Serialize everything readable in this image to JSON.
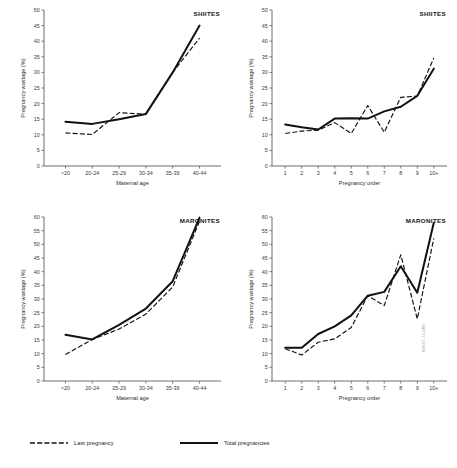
{
  "figure": {
    "credit": "88937-74.4R5"
  },
  "legend": {
    "items": [
      {
        "label": "Last pregnancy",
        "style": "dashed"
      },
      {
        "label": "Total pregnancies",
        "style": "solid"
      }
    ]
  },
  "chart_data": [
    {
      "id": "shiites-maternal-age",
      "type": "line",
      "title": "SHIITES",
      "xlabel": "Maternal age",
      "ylabel": "Pregnancy wastage (%)",
      "categories": [
        "<20",
        "20-24",
        "25-29",
        "30-34",
        "35-39",
        "40-44"
      ],
      "ylim": [
        0,
        50
      ],
      "yticks": [
        0,
        5,
        10,
        15,
        20,
        25,
        30,
        35,
        40,
        45,
        50
      ],
      "grid": false,
      "legend_position": "figure-bottom",
      "series": [
        {
          "name": "Total pregnancies",
          "style": "solid",
          "values": [
            14.2,
            13.5,
            15.0,
            16.7,
            30.0,
            45.0
          ]
        },
        {
          "name": "Last pregnancy",
          "style": "dashed",
          "values": [
            10.6,
            10.1,
            17.1,
            16.6,
            30.0,
            41.0
          ]
        }
      ]
    },
    {
      "id": "shiites-pregnancy-order",
      "type": "line",
      "title": "SHIITES",
      "xlabel": "Pregnancy order",
      "ylabel": "Pregnancy wastage (%)",
      "categories": [
        "1",
        "2",
        "3",
        "4",
        "5",
        "6",
        "7",
        "8",
        "9",
        "10+"
      ],
      "ylim": [
        0,
        50
      ],
      "yticks": [
        0,
        5,
        10,
        15,
        20,
        25,
        30,
        35,
        40,
        45,
        50
      ],
      "grid": false,
      "legend_position": "figure-bottom",
      "series": [
        {
          "name": "Total pregnancies",
          "style": "solid",
          "values": [
            13.3,
            12.4,
            11.7,
            15.2,
            15.3,
            15.2,
            17.5,
            19.0,
            22.5,
            31.2
          ]
        },
        {
          "name": "Last pregnancy",
          "style": "dashed",
          "values": [
            10.4,
            11.2,
            11.5,
            13.9,
            10.4,
            19.4,
            10.8,
            22.0,
            22.4,
            34.6
          ]
        }
      ]
    },
    {
      "id": "maronites-maternal-age",
      "type": "line",
      "title": "MARONITES",
      "xlabel": "Maternal age",
      "ylabel": "Pregnancy wastage (%)",
      "categories": [
        "<20",
        "20-24",
        "25-29",
        "30-34",
        "35-39",
        "40-44"
      ],
      "ylim": [
        0,
        60
      ],
      "yticks": [
        0,
        5,
        10,
        15,
        20,
        25,
        30,
        35,
        40,
        45,
        50,
        55,
        60
      ],
      "grid": false,
      "legend_position": "figure-bottom",
      "series": [
        {
          "name": "Total pregnancies",
          "style": "solid",
          "values": [
            16.9,
            15.2,
            20.5,
            26.5,
            36.5,
            59.8
          ]
        },
        {
          "name": "Last pregnancy",
          "style": "dashed",
          "values": [
            9.7,
            15.2,
            19.0,
            24.5,
            34.4,
            58.5
          ]
        }
      ]
    },
    {
      "id": "maronites-pregnancy-order",
      "type": "line",
      "title": "MARONITES",
      "xlabel": "Pregnancy order",
      "ylabel": "Pregnancy wastage (%)",
      "categories": [
        "1",
        "2",
        "3",
        "4",
        "5",
        "6",
        "7",
        "8",
        "9",
        "10+"
      ],
      "ylim": [
        0,
        60
      ],
      "yticks": [
        0,
        5,
        10,
        15,
        20,
        25,
        30,
        35,
        40,
        45,
        50,
        55,
        60
      ],
      "grid": false,
      "legend_position": "figure-bottom",
      "series": [
        {
          "name": "Total pregnancies",
          "style": "solid",
          "values": [
            12.2,
            12.2,
            17.2,
            20.0,
            24.0,
            31.2,
            32.6,
            42.0,
            32.3,
            57.9
          ]
        },
        {
          "name": "Last pregnancy",
          "style": "dashed",
          "values": [
            11.8,
            9.5,
            14.2,
            15.4,
            19.6,
            31.2,
            27.6,
            46.2,
            22.7,
            52.2
          ]
        }
      ]
    }
  ]
}
